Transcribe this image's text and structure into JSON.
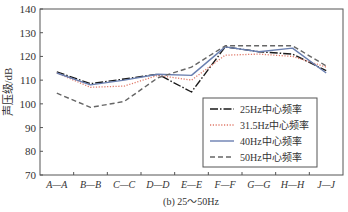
{
  "chart_data": {
    "type": "line",
    "title": "",
    "caption": "(b) 25～50Hz",
    "xlabel": "",
    "ylabel": "声压级/dB",
    "ylim": [
      70,
      140
    ],
    "yticks": [
      70,
      80,
      90,
      100,
      110,
      120,
      130,
      140
    ],
    "grid": false,
    "legend_position": "lower right inside",
    "categories": [
      "A—A",
      "B—B",
      "C—C",
      "D—D",
      "E—E",
      "F—F",
      "G—G",
      "H—H",
      "J—J"
    ],
    "series": [
      {
        "name": "25Hz中心频率",
        "style": "dash-dot",
        "color": "#1a1a1a",
        "values": [
          113.5,
          108.5,
          110.5,
          112.5,
          105,
          124,
          122,
          121,
          114
        ]
      },
      {
        "name": "31.5Hz中心频率",
        "style": "dotted",
        "color": "#e07a6a",
        "values": [
          113,
          107,
          107.5,
          112,
          110,
          120.5,
          121,
          120,
          115.5
        ]
      },
      {
        "name": "40Hz中心频率",
        "style": "solid",
        "color": "#6a7fb0",
        "values": [
          113,
          108,
          110,
          112.5,
          112,
          124,
          122,
          123.5,
          113
        ]
      },
      {
        "name": "50Hz中心频率",
        "style": "dashed",
        "color": "#666666",
        "values": [
          104.5,
          98.5,
          101,
          111,
          115.5,
          124.5,
          124.5,
          124.5,
          116
        ]
      }
    ]
  },
  "axis": {
    "ylabel": "声压级/dB",
    "caption": "(b) 25～50Hz"
  }
}
